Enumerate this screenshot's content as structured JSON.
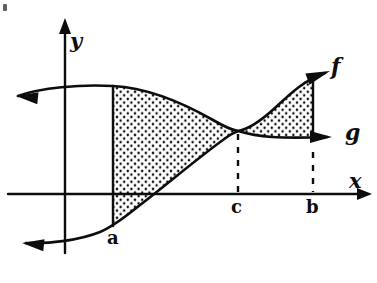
{
  "figure": {
    "background_color": "#ffffff",
    "ink_color": "#0d0d0d",
    "width": 377,
    "height": 283
  },
  "axes": {
    "x_axis": {
      "label": "x",
      "label_pos": {
        "x": 349,
        "y": 170
      },
      "y_pixel": 194,
      "x_start": 8,
      "x_end": 372,
      "arrow": "right"
    },
    "y_axis": {
      "label": "y",
      "label_pos": {
        "x": 70,
        "y": 30
      },
      "x_pixel": 65,
      "y_start": 253,
      "y_end": 18,
      "arrow": "up"
    }
  },
  "curves": [
    {
      "name": "f",
      "role": "upper-curve",
      "label": "f",
      "label_pos": {
        "x": 331,
        "y": 55
      },
      "path": "M 18 96 C 40 88, 80 84, 113 86 C 150 88, 185 104, 213 120 C 225 127, 232 130, 238 131 C 250 129, 262 120, 276 107 C 292 92, 305 80, 325 73",
      "left_arrow": {
        "tip": {
          "x": 16,
          "y": 96
        },
        "direction": "left"
      },
      "right_arrow": {
        "tip": {
          "x": 330,
          "y": 71
        },
        "direction": "up-right"
      }
    },
    {
      "name": "g",
      "role": "lower-curve",
      "label": "g",
      "label_pos": {
        "x": 345,
        "y": 121
      },
      "path": "M 26 243 C 50 244, 80 240, 100 232 C 112 227, 124 218, 140 205 C 170 182, 205 152, 230 135 C 233 133, 236 132, 238 131 C 248 134, 258 136, 272 137 C 288 138, 300 138, 327 137",
      "left_arrow": {
        "tip": {
          "x": 22,
          "y": 243
        },
        "direction": "left"
      },
      "right_arrow": {
        "tip": {
          "x": 332,
          "y": 137
        },
        "direction": "right"
      }
    }
  ],
  "shaded_regions": [
    {
      "name": "region-a-to-c",
      "description": "stippled area between f above and g below from x=a to x=c",
      "fill_pattern": "stipple-dots",
      "path": "M 113 86 C 150 88, 185 104, 213 120 C 225 127, 232 130, 238 131 C 236 132, 233 133, 230 135 C 205 152, 170 182, 140 205 C 124 218, 112 227, 113 226 Z"
    },
    {
      "name": "region-c-to-b",
      "description": "stippled area between f above and g below from x=c to x=b",
      "fill_pattern": "stipple-dots",
      "path": "M 238 131 C 250 129, 262 120, 276 107 C 292 92, 305 80, 313 76 L 313 137 C 300 138, 288 138, 272 137 C 258 136, 248 134, 238 131 Z"
    }
  ],
  "ordinates": [
    {
      "name": "ordinate-at-a",
      "point_label": "a",
      "label_pos": {
        "x": 107,
        "y": 229
      },
      "x_pixel": 113,
      "y_top": 86,
      "y_bottom": 226,
      "style": "solid"
    },
    {
      "name": "ordinate-at-b",
      "point_label": "b",
      "label_pos": {
        "x": 306,
        "y": 198
      },
      "x_pixel": 313,
      "y_top": 76,
      "y_bottom": 137,
      "style": "solid",
      "dashed_extension": {
        "y_from": 152,
        "y_to": 192
      }
    },
    {
      "name": "ordinate-at-c",
      "point_label": "c",
      "label_pos": {
        "x": 231,
        "y": 198
      },
      "x_pixel": 238,
      "y_top": 134,
      "y_bottom": 192,
      "style": "dashed"
    }
  ],
  "intersection_point": {
    "name": "crossing-point-c",
    "x": 238,
    "y": 131
  },
  "stipple": {
    "dot_color": "#0d0d0d",
    "dot_radius": 1.25,
    "spacing": 7.2
  }
}
